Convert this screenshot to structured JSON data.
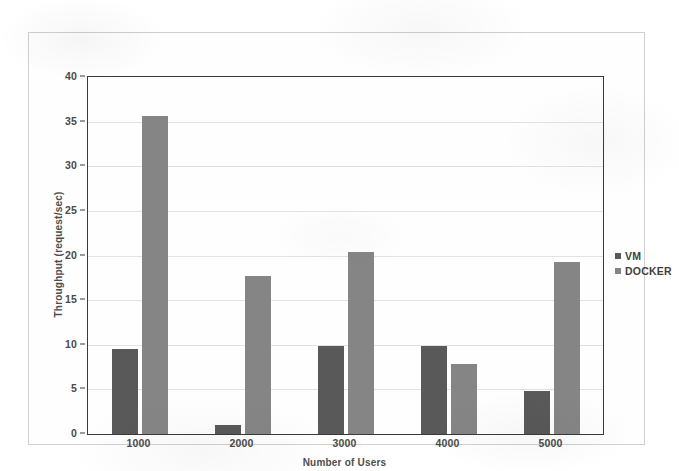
{
  "chart_data": {
    "type": "bar",
    "title": "",
    "xlabel": "Number of Users",
    "ylabel": "Throughput (request/sec)",
    "categories": [
      "1000",
      "2000",
      "3000",
      "4000",
      "5000"
    ],
    "series": [
      {
        "name": "VM",
        "color": "#595959",
        "values": [
          9.5,
          1.0,
          9.9,
          9.9,
          4.8
        ]
      },
      {
        "name": "DOCKER",
        "color": "#858585",
        "values": [
          35.6,
          17.7,
          20.4,
          7.8,
          19.3
        ]
      }
    ],
    "ylim": [
      0,
      40
    ],
    "yticks": [
      0,
      5,
      10,
      15,
      20,
      25,
      30,
      35,
      40
    ],
    "ytick_labels": [
      "0",
      "5",
      "10",
      "15",
      "20",
      "25",
      "30",
      "35",
      "40"
    ],
    "grid": true,
    "legend_position": "right"
  }
}
